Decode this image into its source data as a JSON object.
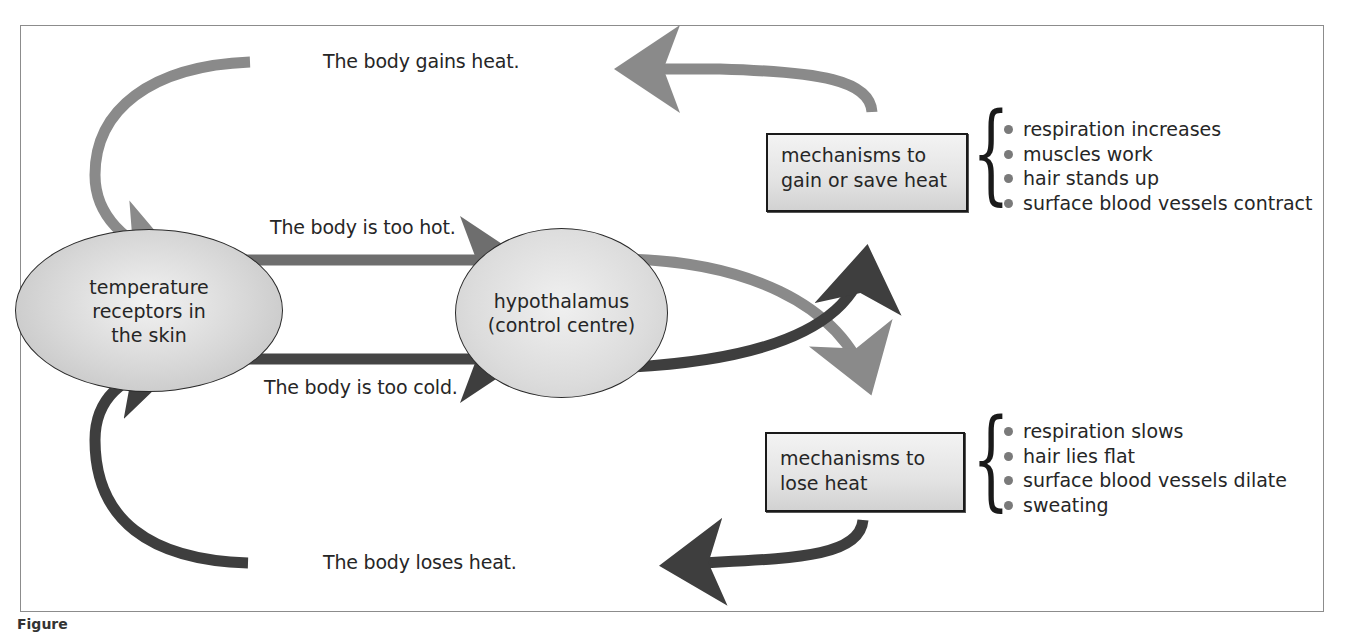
{
  "diagram": {
    "type": "feedback-loop",
    "nodes": {
      "receptors": {
        "label": "temperature receptors in the skin",
        "lines": [
          "temperature",
          "receptors in",
          "the skin"
        ]
      },
      "hypothalamus": {
        "label": "hypothalamus (control centre)",
        "lines": [
          "hypothalamus",
          "(control centre)"
        ]
      },
      "gain_box": {
        "label": "mechanisms to gain or save heat",
        "lines": [
          "mechanisms to",
          "gain or save heat"
        ]
      },
      "lose_box": {
        "label": "mechanisms to lose heat",
        "lines": [
          "mechanisms to",
          "lose heat"
        ]
      }
    },
    "edge_labels": {
      "too_hot": "The body is too hot.",
      "too_cold": "The body is too cold.",
      "gains_heat": "The body gains heat.",
      "loses_heat": "The body loses heat."
    },
    "gain_mechanisms": [
      "respiration increases",
      "muscles work",
      "hair stands up",
      "surface blood vessels contract"
    ],
    "lose_mechanisms": [
      "respiration slows",
      "hair lies flat",
      "surface blood vessels dilate",
      "sweating"
    ],
    "edges": [
      {
        "from": "receptors",
        "to": "hypothalamus",
        "label": "The body is too hot."
      },
      {
        "from": "receptors",
        "to": "hypothalamus",
        "label": "The body is too cold."
      },
      {
        "from": "hypothalamus",
        "to": "lose_box",
        "condition": "too hot"
      },
      {
        "from": "hypothalamus",
        "to": "gain_box",
        "condition": "too cold"
      },
      {
        "from": "gain_box",
        "to": "receptors",
        "label": "The body gains heat."
      },
      {
        "from": "lose_box",
        "to": "receptors",
        "label": "The body loses heat."
      }
    ],
    "colors": {
      "light_arrow": "#8a8a8a",
      "medium_arrow": "#6e6e6e",
      "dark_arrow": "#3e3e3e",
      "node_fill": "#d9d9d9",
      "bullet": "#7a7a7a"
    },
    "brace_glyph": "{",
    "caption": "Figure"
  }
}
